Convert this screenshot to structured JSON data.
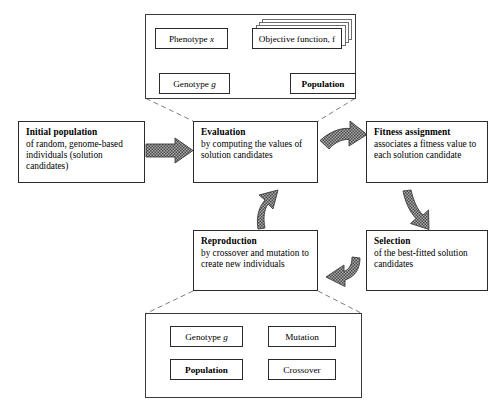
{
  "diagram": {
    "colors": {
      "line": "#2b2b2b",
      "dashed": "#6d6d6d",
      "arrow_fill": "#9a9a9a",
      "arrow_edge": "#3c3c3c",
      "background": "#ffffff"
    }
  },
  "top_panel": {
    "name": "evaluation-detail-panel",
    "nodes": {
      "phenotype": "Phenotype x",
      "objective_function": "Objective function, f",
      "genotype": "Genotype g",
      "population": "Population"
    },
    "objective_stack_count": 4,
    "arrows": [
      {
        "from": "objective_function",
        "to": "phenotype",
        "style": "thin-line",
        "count": 3
      },
      {
        "from": "genotype",
        "to": "phenotype",
        "style": "thin-line"
      },
      {
        "from": "population",
        "to": "genotype",
        "style": "thin-line"
      }
    ]
  },
  "bottom_panel": {
    "name": "reproduction-detail-panel",
    "nodes": {
      "genotype": "Genotype g",
      "mutation": "Mutation",
      "population": "Population",
      "crossover": "Crossover"
    },
    "arrows": [
      {
        "from": "mutation",
        "to": "genotype",
        "style": "thin-line"
      },
      {
        "from": "population",
        "to": "genotype",
        "style": "thin-line"
      },
      {
        "from": "crossover",
        "to": "genotype",
        "style": "thin-line"
      }
    ]
  },
  "cycle": {
    "initial_population": {
      "title": "Initial population",
      "body": "of random, genome-based individuals (solution candidates)"
    },
    "evaluation": {
      "title": "Evaluation",
      "body": "by computing the values of solution candidates"
    },
    "fitness_assignment": {
      "title": "Fitness assignment",
      "body": "associates a fitness value to each solution candidate"
    },
    "selection": {
      "title": "Selection",
      "body": "of the best-fitted solution candidates"
    },
    "reproduction": {
      "title": "Reproduction",
      "body": "by crossover and mutation to create new individuals"
    },
    "flow_arrows": [
      {
        "name": "initial-to-evaluation",
        "from": "initial_population",
        "to": "evaluation",
        "direction": "right"
      },
      {
        "name": "evaluation-to-fitness",
        "from": "evaluation",
        "to": "fitness_assignment",
        "direction": "up-right"
      },
      {
        "name": "fitness-to-selection",
        "from": "fitness_assignment",
        "to": "selection",
        "direction": "down"
      },
      {
        "name": "selection-to-reproduction",
        "from": "selection",
        "to": "reproduction",
        "direction": "left"
      },
      {
        "name": "reproduction-to-evaluation",
        "from": "reproduction",
        "to": "evaluation",
        "direction": "up"
      }
    ]
  }
}
